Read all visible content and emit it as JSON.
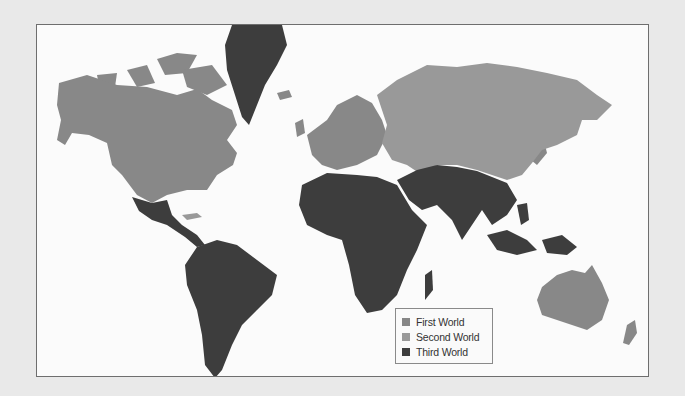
{
  "map": {
    "projection": "world",
    "colors": {
      "first_world": "#868686",
      "second_world": "#999999",
      "third_world": "#3d3d3d",
      "water": "#fbfbfb",
      "page_background": "#e9e9e9"
    }
  },
  "legend": {
    "items": [
      {
        "label": "First World",
        "color": "#868686"
      },
      {
        "label": "Second World",
        "color": "#999999"
      },
      {
        "label": "Third World",
        "color": "#3d3d3d"
      }
    ]
  }
}
